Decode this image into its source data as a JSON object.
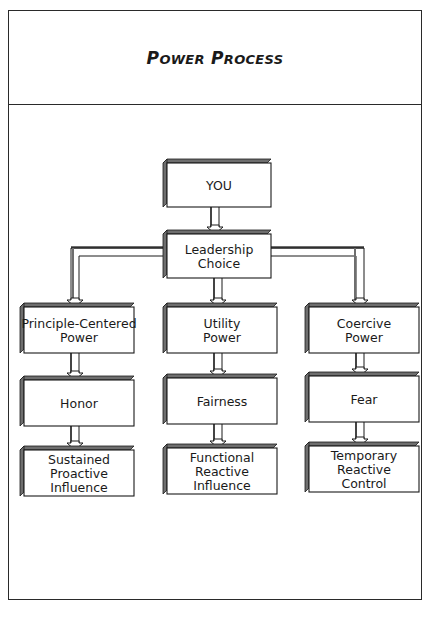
{
  "title": {
    "words": [
      {
        "cap": "P",
        "rest": "OWER"
      },
      {
        "cap": "P",
        "rest": "ROCESS"
      }
    ],
    "full": "Power Process"
  },
  "nodes": {
    "you": {
      "lines": [
        "YOU"
      ]
    },
    "leadership": {
      "lines": [
        "Leadership",
        "Choice"
      ]
    },
    "principle": {
      "lines": [
        "Principle-Centered",
        "Power"
      ]
    },
    "utility": {
      "lines": [
        "Utility",
        "Power"
      ]
    },
    "coercive": {
      "lines": [
        "Coercive",
        "Power"
      ]
    },
    "honor": {
      "lines": [
        "Honor"
      ]
    },
    "fairness": {
      "lines": [
        "Fairness"
      ]
    },
    "fear": {
      "lines": [
        "Fear"
      ]
    },
    "sustained": {
      "lines": [
        "Sustained",
        "Proactive",
        "Influence"
      ]
    },
    "functional": {
      "lines": [
        "Functional",
        "Reactive",
        "Influence"
      ]
    },
    "temporary": {
      "lines": [
        "Temporary",
        "Reactive",
        "Control"
      ]
    }
  },
  "edges": [
    {
      "from": "you",
      "to": "leadership"
    },
    {
      "from": "leadership",
      "to": "principle"
    },
    {
      "from": "leadership",
      "to": "utility"
    },
    {
      "from": "leadership",
      "to": "coercive"
    },
    {
      "from": "principle",
      "to": "honor"
    },
    {
      "from": "utility",
      "to": "fairness"
    },
    {
      "from": "coercive",
      "to": "fear"
    },
    {
      "from": "honor",
      "to": "sustained"
    },
    {
      "from": "fairness",
      "to": "functional"
    },
    {
      "from": "fear",
      "to": "temporary"
    }
  ],
  "colors": {
    "ink": "#1a1a1a",
    "shadow": "#6e6e6e",
    "box_fill": "#ffffff"
  }
}
